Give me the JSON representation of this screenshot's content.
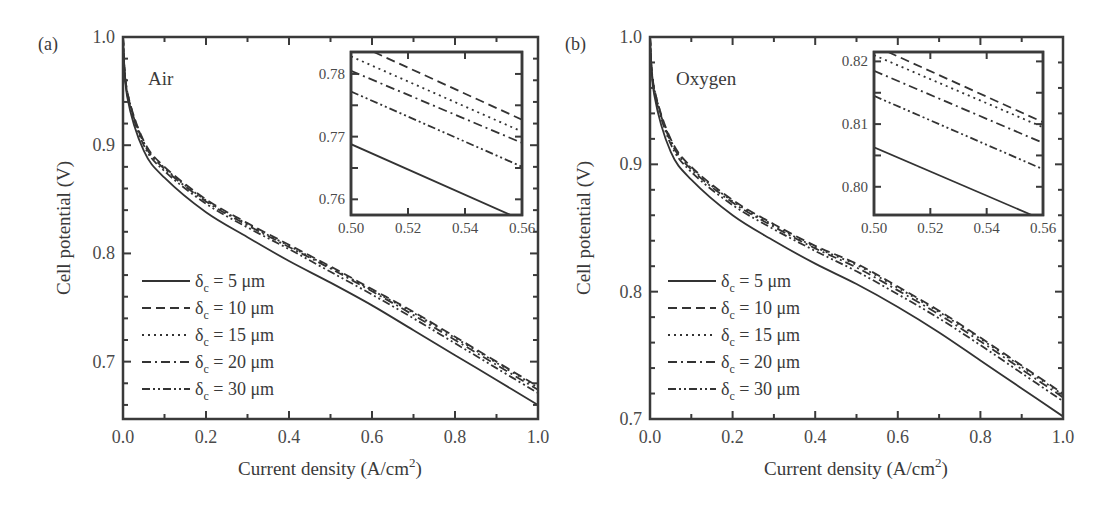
{
  "chart_data": [
    {
      "panel": "(a)",
      "type": "line",
      "annotation": "Air",
      "title": "",
      "xlabel": "Current density (A/cm²)",
      "ylabel": "Cell potential (V)",
      "xlim": [
        0.0,
        1.0
      ],
      "ylim": [
        0.647,
        1.0
      ],
      "xticks": [
        "0.0",
        "0.2",
        "0.4",
        "0.6",
        "0.8",
        "1.0"
      ],
      "yticks": [
        "0.7",
        "0.8",
        "0.9",
        "1.0"
      ],
      "grid": false,
      "legend_position": "lower left",
      "x": [
        0.0,
        0.01,
        0.05,
        0.1,
        0.2,
        0.3,
        0.4,
        0.5,
        0.6,
        0.7,
        0.8,
        0.9,
        1.0
      ],
      "series": [
        {
          "name": "δc = 5 μm",
          "dash": "solid",
          "values": [
            1.0,
            0.945,
            0.895,
            0.87,
            0.838,
            0.815,
            0.793,
            0.773,
            0.752,
            0.729,
            0.706,
            0.683,
            0.66
          ]
        },
        {
          "name": "δc = 10 μm",
          "dash": "dash",
          "values": [
            1.0,
            0.95,
            0.904,
            0.88,
            0.85,
            0.828,
            0.808,
            0.788,
            0.767,
            0.746,
            0.723,
            0.7,
            0.677
          ]
        },
        {
          "name": "δc = 15 μm",
          "dash": "dot",
          "values": [
            1.0,
            0.95,
            0.903,
            0.879,
            0.849,
            0.827,
            0.807,
            0.787,
            0.766,
            0.745,
            0.722,
            0.699,
            0.676
          ]
        },
        {
          "name": "δc = 20 μm",
          "dash": "dashdot",
          "values": [
            1.0,
            0.949,
            0.902,
            0.878,
            0.848,
            0.826,
            0.806,
            0.786,
            0.765,
            0.743,
            0.72,
            0.697,
            0.674
          ]
        },
        {
          "name": "δc = 30 μm",
          "dash": "dashdotdot",
          "values": [
            1.0,
            0.948,
            0.9,
            0.876,
            0.846,
            0.824,
            0.804,
            0.783,
            0.762,
            0.74,
            0.717,
            0.694,
            0.671
          ]
        }
      ],
      "inset": {
        "xlim": [
          0.5,
          0.56
        ],
        "ylim": [
          0.7575,
          0.7835
        ],
        "xticks": [
          "0.50",
          "0.52",
          "0.54",
          "0.56"
        ],
        "yticks": [
          "0.76",
          "0.77",
          "0.78"
        ],
        "series": [
          {
            "name": "δc = 5 μm",
            "x": [
              0.5,
              0.556
            ],
            "values": [
              0.7688,
              0.7575
            ]
          },
          {
            "name": "δc = 10 μm",
            "x": [
              0.508,
              0.56
            ],
            "values": [
              0.7835,
              0.7727
            ]
          },
          {
            "name": "δc = 15 μm",
            "x": [
              0.5,
              0.56
            ],
            "values": [
              0.7828,
              0.7708
            ]
          },
          {
            "name": "δc = 20 μm",
            "x": [
              0.5,
              0.56
            ],
            "values": [
              0.7805,
              0.769
            ]
          },
          {
            "name": "δc = 30 μm",
            "x": [
              0.5,
              0.56
            ],
            "values": [
              0.7772,
              0.7652
            ]
          }
        ]
      }
    },
    {
      "panel": "(b)",
      "type": "line",
      "annotation": "Oxygen",
      "title": "",
      "xlabel": "Current density (A/cm²)",
      "ylabel": "Cell potential (V)",
      "xlim": [
        0.0,
        1.0
      ],
      "ylim": [
        0.7,
        1.0
      ],
      "xticks": [
        "0.0",
        "0.2",
        "0.4",
        "0.6",
        "0.8",
        "1.0"
      ],
      "yticks": [
        "0.7",
        "0.8",
        "0.9",
        "1.0"
      ],
      "grid": false,
      "legend_position": "lower left",
      "x": [
        0.0,
        0.01,
        0.05,
        0.1,
        0.2,
        0.3,
        0.4,
        0.5,
        0.6,
        0.7,
        0.8,
        0.9,
        1.0
      ],
      "series": [
        {
          "name": "δc = 5 μm",
          "dash": "solid",
          "values": [
            1.0,
            0.955,
            0.91,
            0.888,
            0.86,
            0.84,
            0.822,
            0.806,
            0.788,
            0.768,
            0.746,
            0.724,
            0.702
          ]
        },
        {
          "name": "δc = 10 μm",
          "dash": "dash",
          "values": [
            1.0,
            0.96,
            0.92,
            0.898,
            0.872,
            0.853,
            0.836,
            0.822,
            0.804,
            0.785,
            0.764,
            0.742,
            0.72
          ]
        },
        {
          "name": "δc = 15 μm",
          "dash": "dot",
          "values": [
            1.0,
            0.96,
            0.919,
            0.897,
            0.871,
            0.852,
            0.835,
            0.821,
            0.803,
            0.784,
            0.763,
            0.741,
            0.719
          ]
        },
        {
          "name": "δc = 20 μm",
          "dash": "dashdot",
          "values": [
            1.0,
            0.959,
            0.918,
            0.896,
            0.87,
            0.851,
            0.834,
            0.819,
            0.801,
            0.782,
            0.761,
            0.739,
            0.717
          ]
        },
        {
          "name": "δc = 30 μm",
          "dash": "dashdotdot",
          "values": [
            1.0,
            0.958,
            0.916,
            0.894,
            0.868,
            0.849,
            0.832,
            0.816,
            0.798,
            0.779,
            0.758,
            0.736,
            0.714
          ]
        }
      ],
      "inset": {
        "xlim": [
          0.5,
          0.56
        ],
        "ylim": [
          0.7955,
          0.8215
        ],
        "xticks": [
          "0.50",
          "0.52",
          "0.54",
          "0.56"
        ],
        "yticks": [
          "0.80",
          "0.81",
          "0.82"
        ],
        "series": [
          {
            "name": "δc = 5 μm",
            "x": [
              0.5,
              0.556
            ],
            "values": [
              0.8063,
              0.7955
            ]
          },
          {
            "name": "δc = 10 μm",
            "x": [
              0.505,
              0.56
            ],
            "values": [
              0.8215,
              0.8103
            ]
          },
          {
            "name": "δc = 15 μm",
            "x": [
              0.5,
              0.56
            ],
            "values": [
              0.821,
              0.8095
            ]
          },
          {
            "name": "δc = 20 μm",
            "x": [
              0.5,
              0.56
            ],
            "values": [
              0.8185,
              0.807
            ]
          },
          {
            "name": "δc = 30 μm",
            "x": [
              0.5,
              0.56
            ],
            "values": [
              0.8145,
              0.8028
            ]
          }
        ]
      }
    }
  ],
  "labels": {
    "panel_a": "(a)",
    "panel_b": "(b)",
    "annotation_a": "Air",
    "annotation_b": "Oxygen",
    "ylabel": "Cell potential (V)",
    "xlabel_main": "Current density (A/cm",
    "xlabel_sup": "2",
    "xlabel_close": ")",
    "legend": [
      {
        "symbol": "δ",
        "sub": "c",
        "rest": " = 5 μm"
      },
      {
        "symbol": "δ",
        "sub": "c",
        "rest": " = 10 μm"
      },
      {
        "symbol": "δ",
        "sub": "c",
        "rest": " = 15 μm"
      },
      {
        "symbol": "δ",
        "sub": "c",
        "rest": " = 20 μm"
      },
      {
        "symbol": "δ",
        "sub": "c",
        "rest": " = 30 μm"
      }
    ]
  }
}
